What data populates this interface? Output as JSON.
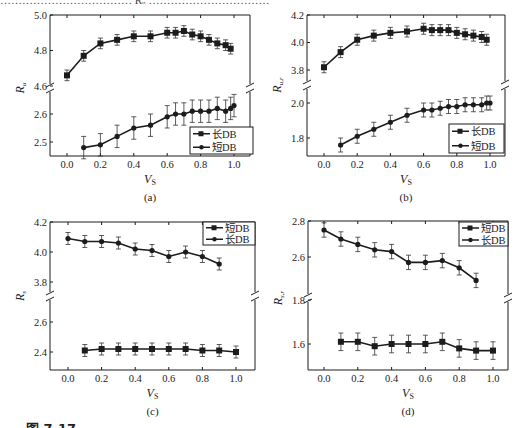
{
  "top_cutoff_text": "……………………………… Rᵤ ……………………………",
  "figure_label": "图 7-17",
  "chart_data": [
    {
      "id": "a",
      "type": "line",
      "subcaption": "(a)",
      "title": "",
      "xlabel": "V_S",
      "ylabel": "R_u",
      "xlim": [
        -0.1,
        1.1
      ],
      "xticks": [
        0.0,
        0.2,
        0.4,
        0.6,
        0.8,
        1.0
      ],
      "xtick_labels": [
        "0.0",
        "0.2",
        "0.4",
        "0.6",
        "0.8",
        "1.0"
      ],
      "broken_y_axis": true,
      "y_upper": {
        "range": [
          4.6,
          5.0
        ],
        "ticks": [
          4.6,
          4.8,
          5.0
        ],
        "tick_labels": [
          "4.6",
          "4.8",
          "5.0"
        ]
      },
      "y_lower": {
        "range": [
          2.45,
          2.7
        ],
        "ticks": [
          2.5,
          2.6
        ],
        "tick_labels": [
          "2.5",
          "2.6"
        ]
      },
      "legend": {
        "position": "lower right",
        "entries": [
          "长DB",
          "短DB"
        ]
      },
      "grid": false,
      "series": [
        {
          "name": "长DB",
          "marker": "square",
          "panel": "upper",
          "x": [
            0.0,
            0.1,
            0.2,
            0.3,
            0.4,
            0.5,
            0.6,
            0.65,
            0.7,
            0.75,
            0.8,
            0.85,
            0.9,
            0.95,
            0.98
          ],
          "values": [
            4.66,
            4.77,
            4.84,
            4.86,
            4.88,
            4.88,
            4.9,
            4.9,
            4.91,
            4.89,
            4.88,
            4.86,
            4.84,
            4.83,
            4.81
          ],
          "error": 0.03
        },
        {
          "name": "短DB",
          "marker": "circle",
          "panel": "lower",
          "x": [
            0.1,
            0.2,
            0.3,
            0.4,
            0.5,
            0.6,
            0.65,
            0.7,
            0.75,
            0.8,
            0.85,
            0.9,
            0.95,
            0.98,
            1.0
          ],
          "values": [
            2.48,
            2.49,
            2.52,
            2.55,
            2.56,
            2.59,
            2.6,
            2.6,
            2.61,
            2.61,
            2.61,
            2.62,
            2.61,
            2.62,
            2.63
          ],
          "error": 0.04
        }
      ]
    },
    {
      "id": "b",
      "type": "line",
      "subcaption": "(b)",
      "title": "",
      "xlabel": "V_S",
      "ylabel": "R_u,r",
      "xlim": [
        -0.1,
        1.1
      ],
      "xticks": [
        0.0,
        0.2,
        0.4,
        0.6,
        0.8,
        1.0
      ],
      "xtick_labels": [
        "0.0",
        "0.2",
        "0.4",
        "0.6",
        "0.8",
        "1.0"
      ],
      "broken_y_axis": true,
      "y_upper": {
        "range": [
          3.75,
          4.2
        ],
        "ticks": [
          3.8,
          4.0,
          4.2
        ],
        "tick_labels": [
          "3.8",
          "4.0",
          "4.2"
        ]
      },
      "y_lower": {
        "range": [
          1.7,
          2.05
        ],
        "ticks": [
          1.8,
          2.0
        ],
        "tick_labels": [
          "1.8",
          "2.0"
        ]
      },
      "legend": {
        "position": "lower right",
        "entries": [
          "长DB",
          "短DB"
        ]
      },
      "grid": false,
      "series": [
        {
          "name": "长DB",
          "marker": "square",
          "panel": "upper",
          "x": [
            0.0,
            0.1,
            0.2,
            0.3,
            0.4,
            0.5,
            0.6,
            0.65,
            0.7,
            0.75,
            0.8,
            0.85,
            0.9,
            0.95,
            0.98
          ],
          "values": [
            3.82,
            3.93,
            4.02,
            4.05,
            4.07,
            4.08,
            4.1,
            4.09,
            4.09,
            4.09,
            4.07,
            4.06,
            4.05,
            4.04,
            4.02
          ],
          "error": 0.04
        },
        {
          "name": "短DB",
          "marker": "circle",
          "panel": "lower",
          "x": [
            0.1,
            0.2,
            0.3,
            0.4,
            0.5,
            0.6,
            0.65,
            0.7,
            0.75,
            0.8,
            0.85,
            0.9,
            0.95,
            0.98,
            1.0
          ],
          "values": [
            1.76,
            1.81,
            1.85,
            1.89,
            1.93,
            1.96,
            1.96,
            1.97,
            1.98,
            1.98,
            1.99,
            1.99,
            1.99,
            2.0,
            2.0
          ],
          "error": 0.04
        }
      ]
    },
    {
      "id": "c",
      "type": "line",
      "subcaption": "(c)",
      "title": "",
      "xlabel": "V_S",
      "ylabel": "R_s",
      "xlim": [
        -0.1,
        1.1
      ],
      "xticks": [
        0.0,
        0.2,
        0.4,
        0.6,
        0.8,
        1.0
      ],
      "xtick_labels": [
        "0.0",
        "0.2",
        "0.4",
        "0.6",
        "0.8",
        "1.0"
      ],
      "broken_y_axis": true,
      "y_upper": {
        "range": [
          3.75,
          4.2
        ],
        "ticks": [
          3.8,
          4.0,
          4.2
        ],
        "tick_labels": [
          "3.8",
          "4.0",
          "4.2"
        ]
      },
      "y_lower": {
        "range": [
          2.3,
          2.7
        ],
        "ticks": [
          2.4,
          2.6
        ],
        "tick_labels": [
          "2.4",
          "2.6"
        ]
      },
      "legend": {
        "position": "upper right",
        "entries": [
          "短DB",
          "长DB"
        ]
      },
      "grid": false,
      "series": [
        {
          "name": "短DB",
          "marker": "square",
          "panel": "lower",
          "x": [
            0.1,
            0.2,
            0.3,
            0.4,
            0.5,
            0.6,
            0.7,
            0.8,
            0.9,
            1.0
          ],
          "values": [
            2.41,
            2.42,
            2.42,
            2.42,
            2.42,
            2.42,
            2.42,
            2.41,
            2.41,
            2.4
          ],
          "error": 0.04
        },
        {
          "name": "长DB",
          "marker": "circle",
          "panel": "upper",
          "x": [
            0.0,
            0.1,
            0.2,
            0.3,
            0.4,
            0.5,
            0.6,
            0.7,
            0.8,
            0.9
          ],
          "values": [
            4.09,
            4.07,
            4.07,
            4.06,
            4.02,
            4.01,
            3.97,
            4.0,
            3.97,
            3.92
          ],
          "error": 0.04
        }
      ]
    },
    {
      "id": "d",
      "type": "line",
      "subcaption": "(d)",
      "title": "",
      "xlabel": "V_S",
      "ylabel": "R_s,r",
      "xlim": [
        -0.1,
        1.1
      ],
      "xticks": [
        0.0,
        0.2,
        0.4,
        0.6,
        0.8,
        1.0
      ],
      "xtick_labels": [
        "0.0",
        "0.2",
        "0.4",
        "0.6",
        "0.8",
        "1.0"
      ],
      "broken_y_axis": true,
      "y_upper": {
        "range": [
          2.4,
          2.8
        ],
        "ticks": [
          2.6,
          2.8
        ],
        "tick_labels": [
          "2.6",
          "2.8"
        ]
      },
      "y_lower": {
        "range": [
          1.5,
          1.85
        ],
        "ticks": [
          1.6,
          1.8
        ],
        "tick_labels": [
          "1.6",
          "1.8"
        ]
      },
      "legend": {
        "position": "upper right",
        "entries": [
          "短DB",
          "长DB"
        ]
      },
      "grid": false,
      "series": [
        {
          "name": "短DB",
          "marker": "square",
          "panel": "lower",
          "x": [
            0.1,
            0.2,
            0.3,
            0.4,
            0.5,
            0.6,
            0.7,
            0.8,
            0.9,
            1.0
          ],
          "values": [
            1.61,
            1.61,
            1.59,
            1.6,
            1.6,
            1.6,
            1.61,
            1.58,
            1.57,
            1.57
          ],
          "error": 0.04
        },
        {
          "name": "长DB",
          "marker": "circle",
          "panel": "upper",
          "x": [
            0.0,
            0.1,
            0.2,
            0.3,
            0.4,
            0.5,
            0.6,
            0.7,
            0.8,
            0.9
          ],
          "values": [
            2.75,
            2.7,
            2.67,
            2.64,
            2.63,
            2.57,
            2.57,
            2.58,
            2.54,
            2.47
          ],
          "error": 0.04
        }
      ]
    }
  ],
  "panels": [
    {
      "box": [
        50,
        15,
        250,
        156
      ],
      "x0": 67,
      "x1": 234,
      "upper": {
        "v0": 5.0,
        "y0": 15,
        "v1": 4.6,
        "y1": 86
      },
      "lower": {
        "v0": 2.6,
        "y0": 114,
        "v1": 2.5,
        "y1": 142
      },
      "break_y": 88,
      "ylabel_main": "R",
      "ylabel_sub": "u",
      "legend_box": [
        190,
        127,
        253,
        154
      ]
    },
    {
      "box": [
        307,
        15,
        505,
        156
      ],
      "x0": 324,
      "x1": 490,
      "upper": {
        "v0": 4.2,
        "y0": 15,
        "v1": 3.8,
        "y1": 70
      },
      "lower": {
        "v0": 2.0,
        "y0": 103,
        "v1": 1.8,
        "y1": 138
      },
      "break_y": 85,
      "ylabel_main": "R",
      "ylabel_sub": "u,r",
      "legend_box": [
        449,
        124,
        504,
        153
      ]
    },
    {
      "box": [
        50,
        222,
        255,
        370
      ],
      "x0": 68,
      "x1": 236,
      "upper": {
        "v0": 4.2,
        "y0": 222,
        "v1": 3.8,
        "y1": 282
      },
      "lower": {
        "v0": 2.6,
        "y0": 322,
        "v1": 2.4,
        "y1": 352
      },
      "break_y": 296,
      "ylabel_main": "R",
      "ylabel_sub": "s",
      "legend_box": [
        203,
        222,
        255,
        245
      ]
    },
    {
      "box": [
        308,
        221,
        508,
        370
      ],
      "x0": 324,
      "x1": 493,
      "upper": {
        "v0": 2.8,
        "y0": 221,
        "v1": 2.6,
        "y1": 257
      },
      "lower": {
        "v0": 1.8,
        "y0": 300,
        "v1": 1.6,
        "y1": 344
      },
      "break_y": 298,
      "ylabel_main": "R",
      "ylabel_sub": "s,r",
      "legend_box": [
        459,
        222,
        508,
        246
      ]
    }
  ]
}
